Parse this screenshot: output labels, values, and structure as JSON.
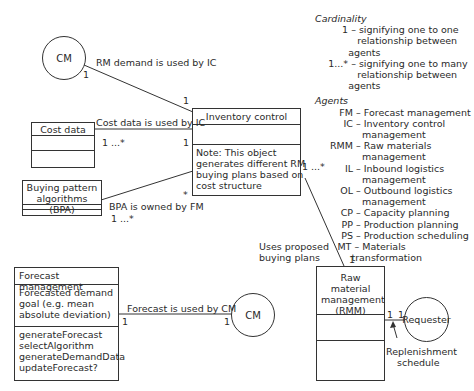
{
  "actors": {
    "cm_top": "CM",
    "cm_bottom": "CM",
    "requester": "Requester"
  },
  "classes": {
    "inventory_control": {
      "name": "Inventory control",
      "note": [
        "Note: This object",
        "generates different RM",
        "buying plans based on",
        "cost structure"
      ]
    },
    "cost_data": {
      "name": "Cost data"
    },
    "bpa": {
      "name": [
        "Buying pattern",
        "algorithms (BPA)"
      ]
    },
    "forecast_management": {
      "name": "Forecast management",
      "attributes": [
        "Forecasted demand",
        "goal (e.g. mean",
        "absolute deviation)"
      ],
      "methods": [
        "generateForecast",
        "selectAlgorithm",
        "generateDemandData",
        "updateForecast?"
      ]
    },
    "rmm": {
      "name": [
        "Raw material",
        "management",
        "(RMM)"
      ]
    }
  },
  "associations": {
    "rm_demand": {
      "label": "RM demand is used by IC",
      "mult_a": "1",
      "mult_b": "1"
    },
    "cost_data": {
      "label": "Cost data is used by IC",
      "mult_a": "1 ...*",
      "mult_b": "1"
    },
    "bpa": {
      "label": "BPA is owned by FM",
      "mult_a": "1 ...*",
      "mult_b": "*"
    },
    "buying_plans": {
      "label": [
        "Uses proposed",
        "buying plans"
      ],
      "mult_a": "1 ...*",
      "mult_b": "1"
    },
    "forecast": {
      "label": "Forecast is used by CM",
      "mult_a": "1",
      "mult_b": "1"
    },
    "replenishment": {
      "label": [
        "Replenishment",
        "schedule"
      ],
      "mult_a": "1",
      "mult_b": "1"
    }
  },
  "legend": {
    "cardinality_title": "Cardinality",
    "cardinality": [
      {
        "key": "1",
        "lines": [
          "signifying one to one",
          "relationship between agents"
        ]
      },
      {
        "key": "1...*",
        "lines": [
          "signifying one to many",
          "relationship between agents"
        ]
      }
    ],
    "agents_title": "Agents",
    "agents": [
      {
        "key": "FM",
        "lines": [
          "Forecast management"
        ]
      },
      {
        "key": "IC",
        "lines": [
          "Inventory control",
          "management"
        ]
      },
      {
        "key": "RMM",
        "lines": [
          "Raw materials",
          "management"
        ]
      },
      {
        "key": "IL",
        "lines": [
          "Inbound logistics",
          "management"
        ]
      },
      {
        "key": "OL",
        "lines": [
          "Outbound logistics",
          "management"
        ]
      },
      {
        "key": "CP",
        "lines": [
          "Capacity planning"
        ]
      },
      {
        "key": "PP",
        "lines": [
          "Production planning"
        ]
      },
      {
        "key": "PS",
        "lines": [
          "Production scheduling"
        ]
      },
      {
        "key": "MT",
        "lines": [
          "Materials transformation"
        ]
      }
    ]
  }
}
